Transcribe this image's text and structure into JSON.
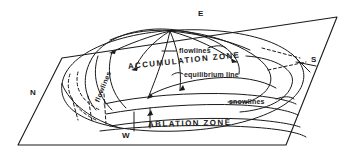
{
  "figure": {
    "kind": "perspective-diagram",
    "background_color": "#ffffff",
    "ink_color": "#1a1a1a",
    "width": 346,
    "height": 155
  },
  "compass": {
    "north": "N",
    "east": "E",
    "south": "S",
    "west": "W"
  },
  "zones": {
    "accumulation": "ACCUMULATION ZONE",
    "ablation": "ABLATION ZONE"
  },
  "annotations": {
    "flowlines_top": "flowlines",
    "flowlines_side": "flowlines",
    "equilibrium_line": "equilibrium line",
    "snowlines": "snowlines"
  }
}
